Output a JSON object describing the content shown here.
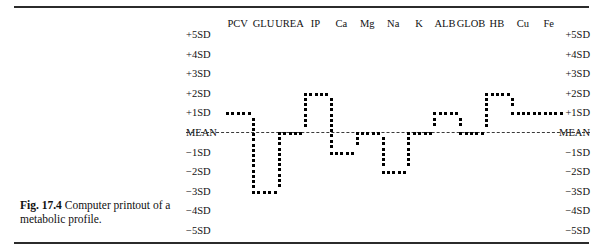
{
  "caption": {
    "figure_number": "Fig. 17.4",
    "text": "Computer printout of a metabolic profile."
  },
  "columns": [
    "PCV",
    "GLU",
    "UREA",
    "IP",
    "Ca",
    "Mg",
    "Na",
    "K",
    "ALB",
    "GLOB",
    "HB",
    "Cu",
    "Fe"
  ],
  "axis_labels_left": [
    "+5SD",
    "+4SD",
    "+3SD",
    "+2SD",
    "+1SD",
    "MEAN",
    "−1SD",
    "−2SD",
    "−3SD",
    "−4SD",
    "−5SD"
  ],
  "axis_labels_right": [
    "+5SD",
    "+4SD",
    "+3SD",
    "+2SD",
    "+1SD",
    "MEAN",
    "−1SD",
    "−2SD",
    "−3SD",
    "−4SD",
    "−5SD"
  ],
  "mean_label": "MEAN",
  "colors": {
    "dot": "#000000",
    "rule": "#2b2b2b",
    "mean_line": "#3a3a3a",
    "text": "#111111",
    "background": "#ffffff"
  },
  "chart_data": {
    "type": "line",
    "title": "Computer printout of a metabolic profile",
    "xlabel": "",
    "ylabel": "Standard deviations from mean",
    "categories": [
      "PCV",
      "GLU",
      "UREA",
      "IP",
      "Ca",
      "Mg",
      "Na",
      "K",
      "ALB",
      "GLOB",
      "HB",
      "Cu",
      "Fe"
    ],
    "ylim": [
      -5,
      5
    ],
    "yticks": [
      5,
      4,
      3,
      2,
      1,
      0,
      -1,
      -2,
      -3,
      -4,
      -5
    ],
    "ytick_labels": [
      "+5SD",
      "+4SD",
      "+3SD",
      "+2SD",
      "+1SD",
      "MEAN",
      "−1SD",
      "−2SD",
      "−3SD",
      "−4SD",
      "−5SD"
    ],
    "grid": false,
    "legend": "none",
    "reference_line": {
      "value": 0,
      "label": "MEAN",
      "style": "dashed"
    },
    "series": [
      {
        "name": "metabolic profile",
        "values": [
          1,
          -3,
          0,
          2,
          -1,
          0,
          -2,
          0,
          1,
          0,
          2,
          1,
          1
        ]
      }
    ],
    "dot_trace_note": "Trace is drawn as a dot-matrix printout: horizontal runs of dots at each analyte's value, joined by vertical columns of dots at the transitions.",
    "segments": [
      {
        "kind": "horizontal",
        "value": 1,
        "from_col": 0,
        "to_col": 1,
        "label": "PCV"
      },
      {
        "kind": "vertical",
        "at_col": 1,
        "from": 1,
        "to": -3
      },
      {
        "kind": "horizontal",
        "value": -3,
        "from_col": 1,
        "to_col": 2,
        "label": "GLU"
      },
      {
        "kind": "vertical",
        "at_col": 2,
        "from": -3,
        "to": 0
      },
      {
        "kind": "horizontal",
        "value": 0,
        "from_col": 2,
        "to_col": 3,
        "label": "UREA"
      },
      {
        "kind": "vertical",
        "at_col": 3,
        "from": 0,
        "to": 2
      },
      {
        "kind": "horizontal",
        "value": 2,
        "from_col": 3,
        "to_col": 4,
        "label": "IP"
      },
      {
        "kind": "vertical",
        "at_col": 4,
        "from": 2,
        "to": -1
      },
      {
        "kind": "horizontal",
        "value": -1,
        "from_col": 4,
        "to_col": 5,
        "label": "Ca"
      },
      {
        "kind": "vertical",
        "at_col": 5,
        "from": -1,
        "to": 0
      },
      {
        "kind": "horizontal",
        "value": 0,
        "from_col": 5,
        "to_col": 6,
        "label": "Mg"
      },
      {
        "kind": "vertical",
        "at_col": 6,
        "from": 0,
        "to": -2
      },
      {
        "kind": "horizontal",
        "value": -2,
        "from_col": 6,
        "to_col": 7,
        "label": "Na"
      },
      {
        "kind": "vertical",
        "at_col": 7,
        "from": -2,
        "to": 0
      },
      {
        "kind": "horizontal",
        "value": 0,
        "from_col": 7,
        "to_col": 8,
        "label": "K"
      },
      {
        "kind": "vertical",
        "at_col": 8,
        "from": 0,
        "to": 1
      },
      {
        "kind": "horizontal",
        "value": 1,
        "from_col": 8,
        "to_col": 9,
        "label": "ALB"
      },
      {
        "kind": "vertical",
        "at_col": 9,
        "from": 1,
        "to": 0
      },
      {
        "kind": "horizontal",
        "value": 0,
        "from_col": 9,
        "to_col": 10,
        "label": "GLOB"
      },
      {
        "kind": "vertical",
        "at_col": 10,
        "from": 0,
        "to": 2
      },
      {
        "kind": "horizontal",
        "value": 2,
        "from_col": 10,
        "to_col": 11,
        "label": "HB"
      },
      {
        "kind": "vertical",
        "at_col": 11,
        "from": 2,
        "to": 1
      },
      {
        "kind": "horizontal",
        "value": 1,
        "from_col": 11,
        "to_col": 13,
        "label": "Cu/Fe"
      }
    ]
  }
}
